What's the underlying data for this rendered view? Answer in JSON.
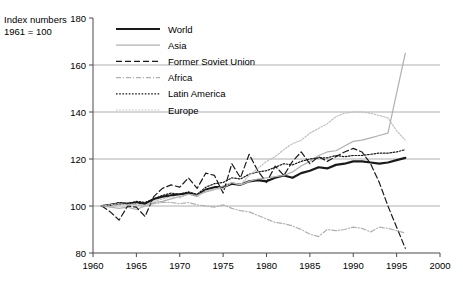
{
  "axis_title": "Index numbers\n1961 = 100",
  "legend": {
    "position": "top-left-inside",
    "entries": [
      {
        "label": "World",
        "color": "#1a1a1a",
        "width": 2.2,
        "dash": "none",
        "key": "world"
      },
      {
        "label": "Asia",
        "color": "#b0b0b0",
        "width": 1.2,
        "dash": "none",
        "key": "asia"
      },
      {
        "label": "Former Soviet Union",
        "color": "#1a1a1a",
        "width": 1.2,
        "dash": "6,3",
        "key": "fsu"
      },
      {
        "label": "Africa",
        "color": "#b0b0b0",
        "width": 1.2,
        "dash": "5,2,1,2",
        "key": "africa"
      },
      {
        "label": "Latin America",
        "color": "#1a1a1a",
        "width": 1.2,
        "dash": "1.6,1.6",
        "key": "latin_america"
      },
      {
        "label": "Europe",
        "color": "#c0c0c0",
        "width": 1.2,
        "dash": "1.6,1.6",
        "key": "europe"
      }
    ]
  },
  "chart_data": {
    "type": "line",
    "title": "",
    "subtitle": "",
    "xlabel": "",
    "ylabel": "Index numbers 1961 = 100",
    "xlim": [
      1960,
      2000
    ],
    "ylim": [
      80,
      180
    ],
    "xticks": [
      1960,
      1965,
      1970,
      1975,
      1980,
      1985,
      1990,
      1995,
      2000
    ],
    "yticks": [
      80,
      100,
      120,
      140,
      160,
      180
    ],
    "gridlines_y": [
      100,
      120,
      140,
      160
    ],
    "grid": true,
    "legend_position": "top-left",
    "x": [
      1961,
      1962,
      1963,
      1964,
      1965,
      1966,
      1967,
      1968,
      1969,
      1970,
      1971,
      1972,
      1973,
      1974,
      1975,
      1976,
      1977,
      1978,
      1979,
      1980,
      1981,
      1982,
      1983,
      1984,
      1985,
      1986,
      1987,
      1988,
      1989,
      1990,
      1991,
      1992,
      1993,
      1994,
      1995,
      1996
    ],
    "series": [
      {
        "name": "World",
        "key": "world",
        "values": [
          100,
          100.5,
          101,
          101,
          101.5,
          101,
          103,
          104,
          104.5,
          105,
          105.5,
          104.5,
          107,
          108,
          108,
          109.5,
          109,
          110.5,
          111,
          110.5,
          112,
          113,
          112,
          114,
          115,
          116.5,
          116,
          117.5,
          118,
          119,
          119,
          118.5,
          118,
          118.5,
          119.5,
          120.5
        ]
      },
      {
        "name": "Asia",
        "key": "asia",
        "values": [
          100,
          99.5,
          99,
          99.5,
          98.5,
          100,
          101.5,
          102,
          103,
          104,
          105,
          104.5,
          106,
          107,
          108.5,
          110,
          109,
          110.5,
          111.5,
          112,
          112.5,
          113,
          114.5,
          117,
          119,
          121.5,
          123,
          123.5,
          125.5,
          127.5,
          128,
          129,
          130,
          131,
          148,
          165
        ]
      },
      {
        "name": "Former Soviet Union",
        "key": "fsu",
        "values": [
          100,
          97.5,
          94,
          100,
          99.5,
          95.5,
          104,
          107.5,
          109,
          108,
          112,
          107.5,
          114,
          113,
          105.5,
          118,
          112,
          122,
          115,
          110,
          117,
          113,
          119,
          123,
          118,
          121,
          119,
          121,
          123,
          124.5,
          123,
          118,
          110,
          100,
          91,
          82
        ]
      },
      {
        "name": "Africa",
        "key": "africa",
        "values": [
          100,
          100,
          100.5,
          101,
          100.5,
          100,
          101,
          101.5,
          101.5,
          101,
          101.5,
          100.5,
          100,
          99.5,
          100.5,
          99,
          98,
          97.5,
          96,
          94.5,
          93,
          92.5,
          91.5,
          90,
          88,
          87,
          90,
          89.5,
          90,
          91,
          90.5,
          89,
          91,
          90.5,
          89.5,
          88.5
        ]
      },
      {
        "name": "Latin America",
        "key": "latin_america",
        "values": [
          100,
          100.5,
          101.5,
          101,
          102,
          101.5,
          103,
          104.5,
          105.5,
          105,
          106,
          105,
          108,
          109.5,
          110,
          112,
          111.5,
          113.5,
          114.5,
          115,
          116.5,
          118,
          117.5,
          119,
          120,
          120.5,
          120.5,
          121.5,
          121,
          121.5,
          121.5,
          122,
          122.5,
          122.5,
          123,
          124
        ]
      },
      {
        "name": "Europe",
        "key": "europe",
        "values": [
          100,
          100.5,
          101,
          100.5,
          101,
          100,
          102,
          103,
          104,
          103.5,
          105,
          104,
          106.5,
          107,
          107.5,
          110,
          109,
          113,
          116,
          119,
          121,
          124,
          126.5,
          128,
          131,
          133,
          135,
          138,
          139.5,
          140,
          140,
          139.5,
          138.5,
          137.5,
          132,
          128
        ]
      }
    ]
  }
}
